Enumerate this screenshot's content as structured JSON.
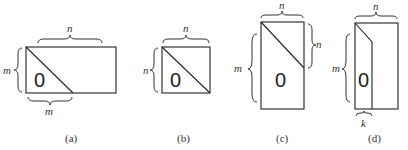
{
  "panels": [
    {
      "id": "a",
      "caption": "(a)",
      "zero": "0",
      "labels": {
        "top": "n",
        "left": "m",
        "bottom": "m"
      }
    },
    {
      "id": "b",
      "caption": "(b)",
      "zero": "0",
      "labels": {
        "top": "n",
        "left": "n"
      }
    },
    {
      "id": "c",
      "caption": "(c)",
      "zero": "0",
      "labels": {
        "top": "n",
        "right": "n",
        "left": "m"
      }
    },
    {
      "id": "d",
      "caption": "(d)",
      "zero": "0",
      "labels": {
        "top": "n",
        "left": "m",
        "bottom": "k"
      }
    }
  ]
}
